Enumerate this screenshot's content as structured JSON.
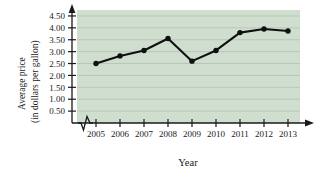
{
  "chart_data": {
    "type": "line",
    "title": "",
    "xlabel": "Year",
    "ylabel": "Average price (in dollars per gallon)",
    "ylabel_line1": "Average price",
    "ylabel_line2": "(in dollars per gallon)",
    "categories": [
      "2005",
      "2006",
      "2007",
      "2008",
      "2009",
      "2010",
      "2011",
      "2012",
      "2013"
    ],
    "x": [
      2005,
      2006,
      2007,
      2008,
      2009,
      2010,
      2011,
      2012,
      2013
    ],
    "values": [
      2.5,
      2.82,
      3.05,
      3.55,
      2.6,
      3.05,
      3.8,
      3.95,
      3.87
    ],
    "ylim": [
      0,
      4.75
    ],
    "ytick_labels": [
      "0.50",
      "1.00",
      "1.50",
      "2.00",
      "2.50",
      "3.00",
      "3.50",
      "4.00",
      "4.50"
    ],
    "ytick_values": [
      0.5,
      1.0,
      1.5,
      2.0,
      2.5,
      3.0,
      3.5,
      4.0,
      4.5
    ],
    "grid": true,
    "legend": null,
    "axis_break": "x-axis zigzag break between origin and 2005",
    "colors": {
      "plot_background": "#cfdece",
      "gridline": "#b3c6b3",
      "series_line": "#101010",
      "marker": "#101010",
      "axis": "#1a1a1a",
      "page_background": "#ffffff"
    }
  }
}
